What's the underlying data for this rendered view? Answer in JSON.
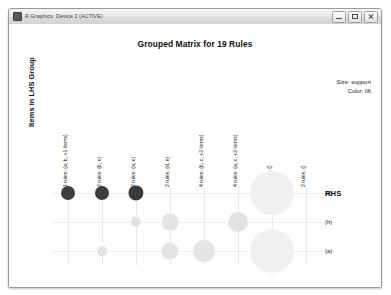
{
  "window": {
    "title": "R Graphics: Device 2 (ACTIVE)",
    "icon": "r-graphics-icon",
    "buttons": {
      "minimize": "minimize-icon",
      "maximize": "maximize-icon",
      "close": "close-icon"
    }
  },
  "plot": {
    "title": "Grouped Matrix for 19 Rules",
    "ylabel": "Items in LHS Group",
    "rhs_header": "RHS",
    "legend": {
      "size": "Size: support",
      "color": "Color: lift"
    }
  },
  "chart_data": {
    "type": "scatter",
    "title": "Grouped Matrix for 19 Rules",
    "xlabel": "",
    "ylabel": "Items in LHS Group",
    "legend_position": "top-right",
    "size_encodes": "support",
    "color_encodes": "lift",
    "grid": true,
    "categories": [
      "1 rules: {a, b, +1 items}",
      "2 rules: {b, e}",
      "2 rules: {a, e}",
      "2 rules: {d, e}",
      "4 rules: {b, c, +2 items}",
      "4 rules: {a, c, +2 items}",
      "2 rules: {}",
      "2 rules: {}"
    ],
    "rows": [
      "{d}",
      "{h}",
      "{a}"
    ],
    "points": [
      {
        "col": 0,
        "row": 0,
        "size": 7.0,
        "color": "#3d3d3d"
      },
      {
        "col": 1,
        "row": 0,
        "size": 7.0,
        "color": "#3d3d3d"
      },
      {
        "col": 2,
        "row": 0,
        "size": 7.6,
        "color": "#3a3a3a"
      },
      {
        "col": 2,
        "row": 1,
        "size": 5.2,
        "color": "#e0e0e0"
      },
      {
        "col": 1,
        "row": 2,
        "size": 4.8,
        "color": "#e2e2e2"
      },
      {
        "col": 3,
        "row": 1,
        "size": 8.4,
        "color": "#e4e4e4"
      },
      {
        "col": 3,
        "row": 2,
        "size": 8.6,
        "color": "#e4e4e4"
      },
      {
        "col": 4,
        "row": 2,
        "size": 11.0,
        "color": "#e6e6e6"
      },
      {
        "col": 5,
        "row": 1,
        "size": 10.0,
        "color": "#e2e2e2"
      },
      {
        "col": 6,
        "row": 0,
        "size": 22.0,
        "color": "#f0f0f0"
      },
      {
        "col": 6,
        "row": 2,
        "size": 22.0,
        "color": "#f0f0f0"
      }
    ]
  }
}
